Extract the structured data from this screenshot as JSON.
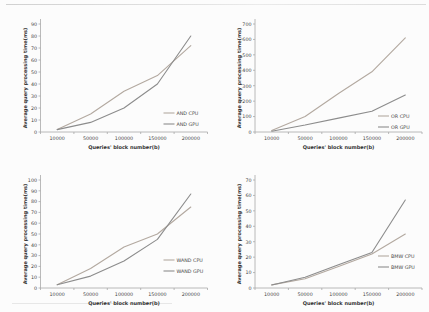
{
  "figure": {
    "shared_xlabel": "Queries' block number(b)",
    "shared_ylabel": "Average query processing time(ms)"
  },
  "colors": {
    "cpu_line": "#b3a9a0",
    "gpu_line": "#8c8c8c",
    "axis": "#a8a8a8",
    "tick_text": "#454545",
    "label_text": "#333333",
    "background": "#fcfcfc"
  },
  "chart_data": [
    {
      "id": "and",
      "type": "line",
      "title": "",
      "xlabel": "Queries' block number(b)",
      "ylabel": "Average query processing time(ms)",
      "categories": [
        "10000",
        "50000",
        "100000",
        "150000",
        "200000"
      ],
      "ylim": [
        0,
        90
      ],
      "ytick_step": 10,
      "grid": false,
      "legend_position": "inside lower right",
      "legend_y": 113,
      "series": [
        {
          "name": "AND CPU",
          "color": "#b3a9a0",
          "values": [
            2,
            15,
            34,
            47,
            72
          ]
        },
        {
          "name": "AND GPU",
          "color": "#8c8c8c",
          "values": [
            2,
            8,
            20,
            40,
            80
          ]
        }
      ]
    },
    {
      "id": "or",
      "type": "line",
      "title": "",
      "xlabel": "Queries' block number(b)",
      "ylabel": "Average query processing time(ms)",
      "categories": [
        "10000",
        "50000",
        "100000",
        "150000",
        "200000"
      ],
      "ylim": [
        0,
        700
      ],
      "ytick_step": 100,
      "grid": false,
      "legend_position": "inside lower right",
      "legend_y": 116,
      "series": [
        {
          "name": "OR CPU",
          "color": "#b3a9a0",
          "values": [
            10,
            100,
            250,
            390,
            610
          ]
        },
        {
          "name": "OR GPU",
          "color": "#8c8c8c",
          "values": [
            5,
            45,
            90,
            135,
            240
          ]
        }
      ]
    },
    {
      "id": "wand",
      "type": "line",
      "title": "",
      "xlabel": "Queries' block number(b)",
      "ylabel": "Average query processing time(ms)",
      "categories": [
        "10000",
        "50000",
        "100000",
        "150000",
        "200000"
      ],
      "ylim": [
        0,
        100
      ],
      "ytick_step": 10,
      "grid": false,
      "legend_position": "inside lower right",
      "legend_y": 104,
      "series": [
        {
          "name": "WAND CPU",
          "color": "#b3a9a0",
          "values": [
            3,
            18,
            38,
            50,
            75
          ]
        },
        {
          "name": "WAND GPU",
          "color": "#8c8c8c",
          "values": [
            3,
            11,
            25,
            45,
            87
          ]
        }
      ]
    },
    {
      "id": "bmw",
      "type": "line",
      "title": "",
      "xlabel": "Queries' block number(b)",
      "ylabel": "Average query processing time(ms)",
      "categories": [
        "10000",
        "50000",
        "100000",
        "150000",
        "200000"
      ],
      "ylim": [
        0,
        70
      ],
      "ytick_step": 10,
      "grid": false,
      "legend_position": "inside lower right",
      "legend_y": 100,
      "series": [
        {
          "name": "BMW CPU",
          "color": "#b3a9a0",
          "values": [
            2,
            6,
            14,
            22,
            35
          ]
        },
        {
          "name": "BMW GPU",
          "color": "#8c8c8c",
          "values": [
            2,
            7,
            15,
            23,
            57
          ]
        }
      ]
    }
  ]
}
